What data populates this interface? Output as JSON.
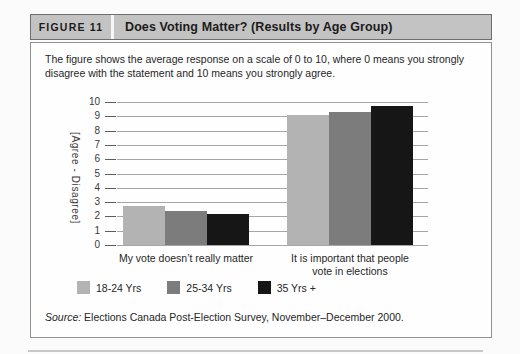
{
  "figure": {
    "label": "FIGURE 11",
    "title": "Does Voting Matter? (Results by Age Group)",
    "description": "The figure shows the average response on a scale of 0 to 10, where 0 means you strongly disagree with the statement and 10 means you strongly agree.",
    "source_prefix": "Source:",
    "source_text": " Elections Canada Post-Election Survey, November–December 2000."
  },
  "chart_data": {
    "type": "bar",
    "title": "Does Voting Matter? (Results by Age Group)",
    "categories": [
      "My vote doesn’t really matter",
      "It is important that people\nvote in elections"
    ],
    "series": [
      {
        "name": "18-24 Yrs",
        "color": "#b3b3b3",
        "values": [
          2.7,
          9.1
        ]
      },
      {
        "name": "25-34 Yrs",
        "color": "#7c7c7c",
        "values": [
          2.4,
          9.3
        ]
      },
      {
        "name": "35 Yrs +",
        "color": "#161616",
        "values": [
          2.2,
          9.7
        ]
      }
    ],
    "xlabel": "",
    "ylabel": "[Agree - Disagree]",
    "ylim": [
      0,
      10
    ],
    "ytick_step": 1,
    "grid": true,
    "legend_position": "bottom"
  }
}
